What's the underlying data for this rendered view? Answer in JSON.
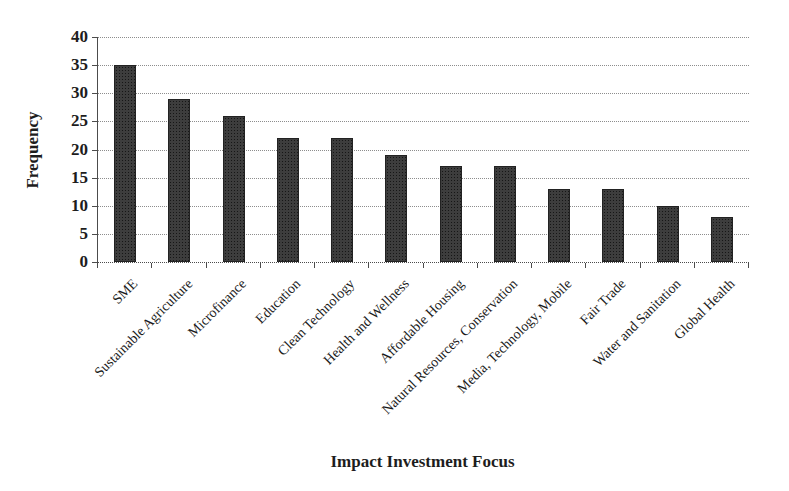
{
  "chart_data": {
    "type": "bar",
    "categories": [
      "SME",
      "Sustainable Agriculture",
      "Microfinance",
      "Education",
      "Clean Technology",
      "Health and Wellness",
      "Affordable Housing",
      "Natural Resources, Conservation",
      "Media, Technology, Mobile",
      "Fair Trade",
      "Water and Sanitation",
      "Global Health"
    ],
    "values": [
      35,
      29,
      26,
      22,
      22,
      19,
      17,
      17,
      13,
      13,
      10,
      8
    ],
    "xlabel": "Impact Investment Focus",
    "ylabel": "Frequency",
    "ylim": [
      0,
      40
    ],
    "ytick_step": 5,
    "yticks": [
      0,
      5,
      10,
      15,
      20,
      25,
      30,
      35,
      40
    ],
    "grid": "horizontal-dotted",
    "legend": "none",
    "bar_color": "#3d3d3d",
    "gridline_color": "#8d8d8d",
    "axis_color": "#4c4c4c",
    "background": "#ffffff"
  }
}
